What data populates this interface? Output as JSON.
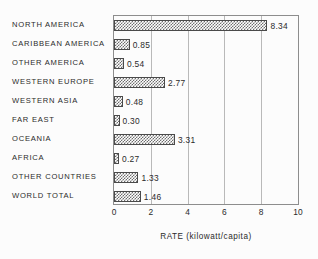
{
  "chart_data": {
    "type": "bar",
    "orientation": "horizontal",
    "title": "",
    "xlabel": "RATE (kilowatt/capita)",
    "ylabel": "",
    "xlim": [
      0,
      10
    ],
    "xticks": [
      "0",
      "2",
      "4",
      "6",
      "8",
      "10"
    ],
    "grid": true,
    "legend": null,
    "categories": [
      "NORTH AMERICA",
      "CARIBBEAN AMERICA",
      "OTHER AMERICA",
      "WESTERN EUROPE",
      "WESTERN ASIA",
      "FAR EAST",
      "OCEANIA",
      "AFRICA",
      "OTHER COUNTRIES",
      "WORLD TOTAL"
    ],
    "values": [
      8.34,
      0.85,
      0.54,
      2.77,
      0.48,
      0.3,
      3.31,
      0.27,
      1.33,
      1.46
    ],
    "value_labels": [
      "8.34",
      "0.85",
      "0.54",
      "2.77",
      "0.48",
      "0.30",
      "3.31",
      "0.27",
      "1.33",
      "1.46"
    ],
    "colors": {
      "bar_fill": "#6e6e6e",
      "bar_edge": "#4a4a4a",
      "axis": "#8d8d8d",
      "grid": "#b9b9b9",
      "text": "#2b2b2b",
      "background": "#fcfcfc"
    }
  }
}
